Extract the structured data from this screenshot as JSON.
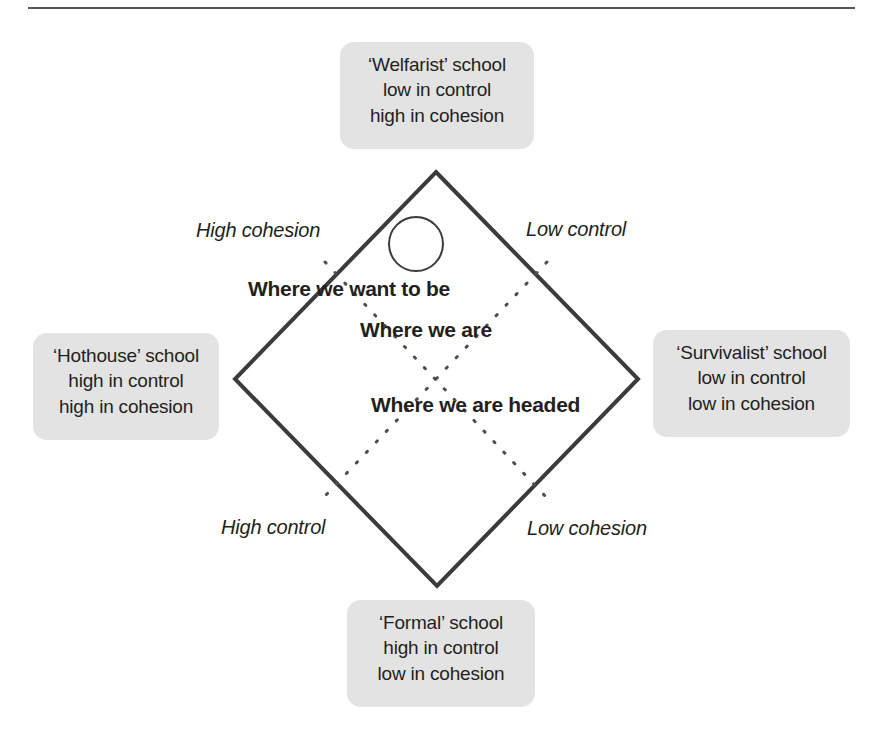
{
  "figure": {
    "title_rule": "horizontal-rule",
    "colors": {
      "box_fill": "#e3e3e3",
      "diamond_stroke": "#3b3b3b",
      "dotted_stroke": "#4d4d4d",
      "text": "#231f20",
      "rule": "#58595b",
      "background": "#ffffff"
    }
  },
  "quadrant_boxes": [
    {
      "id": "welfarist",
      "position": "top",
      "lines": [
        "‘Welfarist’ school",
        "low in control",
        "high in cohesion"
      ]
    },
    {
      "id": "hothouse",
      "position": "left",
      "lines": [
        "‘Hothouse’ school",
        "high in control",
        "high in cohesion"
      ]
    },
    {
      "id": "survivalist",
      "position": "right",
      "lines": [
        "‘Survivalist’ school",
        "low in control",
        "low in cohesion"
      ]
    },
    {
      "id": "formal",
      "position": "bottom",
      "lines": [
        "‘Formal’ school",
        "high in control",
        "low in cohesion"
      ]
    }
  ],
  "axis_labels": {
    "upper_left": "High cohesion",
    "upper_right": "Low control",
    "lower_left": "High control",
    "lower_right": "Low cohesion"
  },
  "annotations": [
    {
      "id": "want-to-be",
      "text": "Where we want to be"
    },
    {
      "id": "we-are",
      "text": "Where we are"
    },
    {
      "id": "headed",
      "text": "Where we are headed"
    }
  ],
  "markers": {
    "current_position_circle": "open-circle-marker"
  }
}
